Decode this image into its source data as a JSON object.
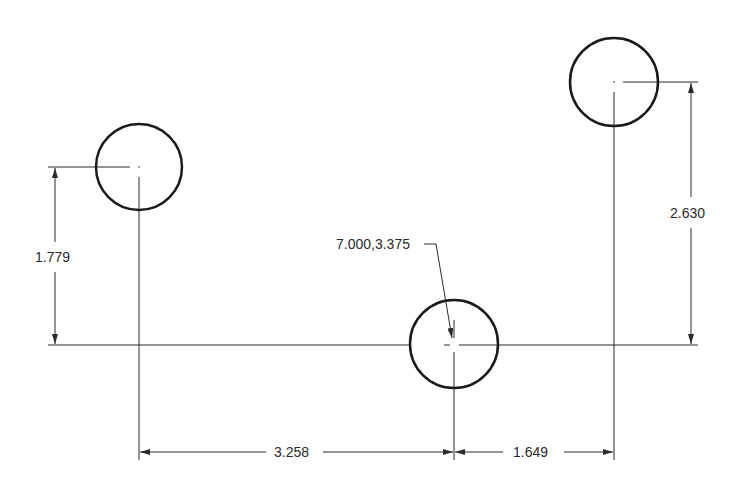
{
  "drawing": {
    "type": "hole-location dimension drawing",
    "colors": {
      "background": "#ffffff",
      "line": "#2a2a2a"
    },
    "holes": [
      {
        "name": "left-hole",
        "cx": 139,
        "cy": 167,
        "r": 43
      },
      {
        "name": "middle-hole",
        "cx": 454,
        "cy": 344,
        "r": 44
      },
      {
        "name": "right-hole",
        "cx": 614,
        "cy": 82,
        "r": 44
      }
    ],
    "dimensions": {
      "left_vertical": "1.779",
      "right_vertical": "2.630",
      "bottom_left_horizontal": "3.258",
      "bottom_right_horizontal": "1.649"
    },
    "leader_note": "7.000,3.375"
  }
}
